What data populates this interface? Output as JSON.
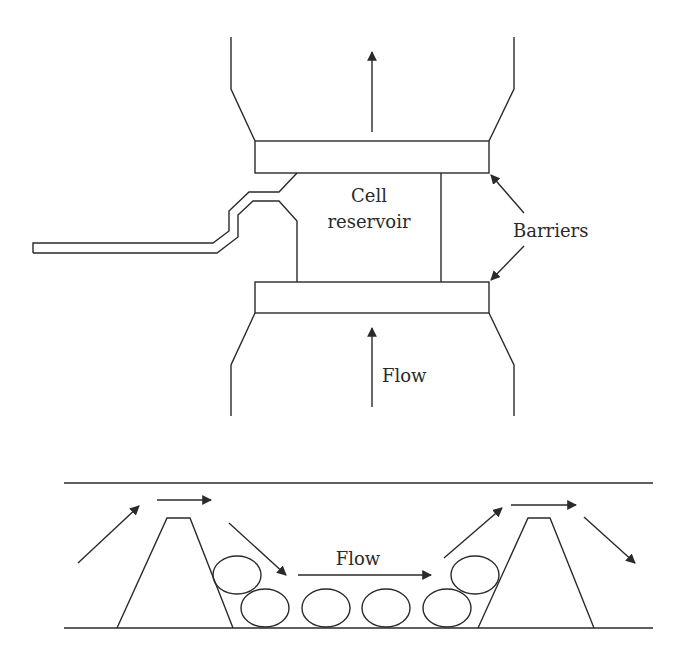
{
  "diagram": {
    "top_view": {
      "reservoir_label_line1": "Cell",
      "reservoir_label_line2": "reservoir",
      "barriers_label": "Barriers",
      "flow_label": "Flow"
    },
    "side_view": {
      "flow_label": "Flow",
      "particle_count": 6,
      "obstacle_count": 2
    },
    "colors": {
      "stroke": "#2a2a2a",
      "background": "#ffffff"
    }
  }
}
